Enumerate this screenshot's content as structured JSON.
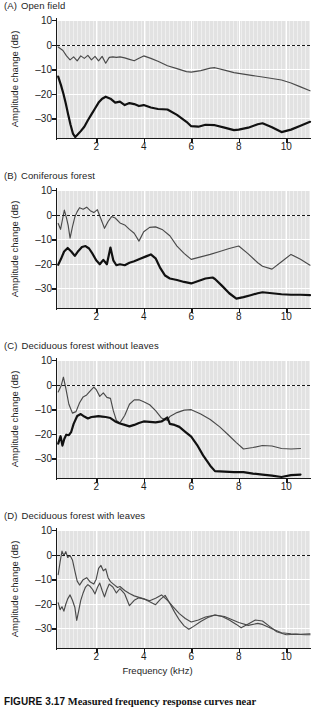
{
  "figure": {
    "caption_number": "FIGURE 3.17",
    "caption_text": "Measured frequency response curves near"
  },
  "axes": {
    "ylabel": "Amplitude change (dB)",
    "xlabel": "Frequency (kHz)",
    "yticks": [
      "10",
      "0",
      "–10",
      "–20",
      "–30"
    ],
    "xticks": [
      "2",
      "4",
      "6",
      "8",
      "10"
    ]
  },
  "panels": [
    {
      "tag": "(A)",
      "title": "Open field"
    },
    {
      "tag": "(B)",
      "title": "Coniferous forest"
    },
    {
      "tag": "(C)",
      "title": "Deciduous forest without leaves"
    },
    {
      "tag": "(D)",
      "title": "Deciduous forest with leaves"
    }
  ],
  "chart_data": {
    "type": "line",
    "title": "Measured frequency response curves near",
    "xlabel": "Frequency (kHz)",
    "ylabel": "Amplitude change (dB)",
    "xlim": [
      0.35,
      11.0
    ],
    "ylim": [
      -38,
      10
    ],
    "yticks": [
      10,
      0,
      -10,
      -20,
      -30
    ],
    "xticks": [
      2,
      4,
      6,
      8,
      10
    ],
    "grid": true,
    "legend": "none",
    "reference_line": {
      "y": 0,
      "style": "dashed"
    },
    "panels": [
      {
        "label": "(A)",
        "title": "Open field",
        "series": [
          {
            "name": "near-ground (thin)",
            "weight": "thin",
            "x": [
              0.4,
              0.6,
              0.75,
              0.9,
              1.05,
              1.2,
              1.35,
              1.5,
              1.65,
              1.8,
              1.95,
              2.1,
              2.25,
              2.4,
              2.55,
              2.7,
              2.85,
              3.0,
              3.2,
              3.4,
              3.6,
              3.8,
              4.0,
              4.3,
              4.6,
              5.0,
              5.4,
              5.8,
              6.0,
              6.4,
              6.8,
              7.0,
              7.4,
              7.8,
              8.2,
              8.6,
              9.0,
              9.4,
              9.8,
              10.2,
              10.6,
              11.0
            ],
            "y": [
              -1.0,
              -2.4,
              -4.6,
              -6.2,
              -5.0,
              -6.6,
              -4.6,
              -5.6,
              -4.4,
              -6.2,
              -4.8,
              -6.6,
              -4.8,
              -7.6,
              -5.2,
              -5.0,
              -5.2,
              -5.0,
              -5.4,
              -6.0,
              -6.6,
              -5.6,
              -4.6,
              -5.6,
              -6.8,
              -8.6,
              -9.8,
              -11.0,
              -11.2,
              -10.6,
              -9.6,
              -9.4,
              -10.4,
              -11.4,
              -12.0,
              -12.6,
              -13.2,
              -13.8,
              -14.4,
              -15.6,
              -17.2,
              -18.8
            ]
          },
          {
            "name": "far (thick)",
            "weight": "thick",
            "x": [
              0.4,
              0.52,
              0.62,
              0.72,
              0.82,
              0.92,
              1.02,
              1.12,
              1.22,
              1.35,
              1.5,
              1.65,
              1.8,
              1.95,
              2.1,
              2.25,
              2.4,
              2.6,
              2.8,
              3.0,
              3.2,
              3.4,
              3.6,
              3.8,
              4.0,
              4.3,
              4.6,
              5.0,
              5.4,
              5.8,
              6.0,
              6.3,
              6.6,
              7.0,
              7.4,
              7.8,
              8.0,
              8.4,
              8.8,
              9.0,
              9.4,
              9.8,
              10.2,
              10.6,
              11.0
            ],
            "y": [
              -13.0,
              -16.6,
              -20.0,
              -24.0,
              -28.4,
              -32.6,
              -36.2,
              -37.6,
              -36.6,
              -35.2,
              -33.4,
              -30.8,
              -28.4,
              -26.0,
              -23.6,
              -22.0,
              -21.2,
              -22.0,
              -23.6,
              -23.2,
              -24.6,
              -23.8,
              -24.2,
              -25.0,
              -24.6,
              -25.6,
              -26.2,
              -26.4,
              -28.6,
              -31.4,
              -33.2,
              -33.4,
              -32.6,
              -32.8,
              -33.8,
              -34.8,
              -34.6,
              -33.8,
              -32.4,
              -32.0,
              -33.6,
              -35.6,
              -34.6,
              -33.0,
              -31.4
            ]
          }
        ]
      },
      {
        "label": "(B)",
        "title": "Coniferous forest",
        "series": [
          {
            "name": "near-ground (thin)",
            "weight": "thin",
            "x": [
              0.4,
              0.5,
              0.58,
              0.66,
              0.74,
              0.82,
              0.9,
              1.0,
              1.1,
              1.2,
              1.3,
              1.45,
              1.6,
              1.75,
              1.9,
              2.05,
              2.2,
              2.35,
              2.5,
              2.65,
              2.8,
              3.0,
              3.2,
              3.4,
              3.6,
              3.8,
              4.0,
              4.25,
              4.5,
              4.8,
              5.1,
              5.4,
              5.7,
              6.0,
              6.4,
              6.8,
              7.2,
              7.6,
              8.0,
              8.4,
              8.8,
              9.0,
              9.4,
              9.8,
              10.2,
              10.6,
              11.0
            ],
            "y": [
              -3.6,
              -6.0,
              -2.0,
              1.8,
              -1.0,
              -4.4,
              -9.6,
              -5.0,
              -1.0,
              1.2,
              2.8,
              2.2,
              3.0,
              1.6,
              0.8,
              2.0,
              -1.8,
              -5.6,
              -2.8,
              -0.8,
              -1.4,
              -3.4,
              -4.2,
              -6.0,
              -7.6,
              -10.8,
              -7.0,
              -5.2,
              -5.0,
              -6.2,
              -8.6,
              -12.8,
              -15.8,
              -18.2,
              -17.2,
              -16.2,
              -15.0,
              -13.8,
              -12.8,
              -16.0,
              -19.6,
              -21.0,
              -22.2,
              -19.2,
              -16.2,
              -18.2,
              -20.6
            ]
          },
          {
            "name": "far (thick)",
            "weight": "thick",
            "x": [
              0.4,
              0.52,
              0.65,
              0.8,
              0.95,
              1.1,
              1.25,
              1.4,
              1.55,
              1.7,
              1.85,
              2.0,
              2.15,
              2.3,
              2.45,
              2.6,
              2.72,
              2.85,
              3.0,
              3.2,
              3.4,
              3.6,
              3.85,
              4.1,
              4.3,
              4.5,
              4.7,
              4.9,
              5.1,
              5.4,
              5.7,
              6.0,
              6.3,
              6.6,
              6.9,
              7.0,
              7.3,
              7.6,
              7.9,
              8.2,
              8.5,
              8.8,
              9.0,
              9.4,
              9.8,
              10.2,
              10.6,
              11.0
            ],
            "y": [
              -20.4,
              -18.0,
              -15.0,
              -13.6,
              -15.0,
              -16.8,
              -14.8,
              -13.2,
              -12.8,
              -13.8,
              -16.0,
              -18.6,
              -20.2,
              -18.4,
              -20.2,
              -13.4,
              -18.6,
              -20.6,
              -20.2,
              -20.6,
              -19.6,
              -19.0,
              -18.0,
              -17.0,
              -16.2,
              -17.8,
              -21.8,
              -24.8,
              -26.0,
              -26.6,
              -27.4,
              -28.0,
              -27.0,
              -26.0,
              -25.6,
              -26.2,
              -29.0,
              -32.0,
              -34.2,
              -33.6,
              -32.8,
              -32.0,
              -31.6,
              -32.0,
              -32.4,
              -32.6,
              -32.6,
              -32.8
            ]
          }
        ]
      },
      {
        "label": "(C)",
        "title": "Deciduous forest without leaves",
        "series": [
          {
            "name": "near-ground (thin)",
            "weight": "thin",
            "x": [
              0.4,
              0.52,
              0.62,
              0.72,
              0.85,
              1.0,
              1.15,
              1.3,
              1.45,
              1.6,
              1.75,
              1.9,
              2.0,
              2.15,
              2.3,
              2.45,
              2.6,
              2.72,
              2.85,
              3.0,
              3.2,
              3.4,
              3.6,
              3.8,
              4.0,
              4.25,
              4.5,
              4.75,
              5.0,
              5.1,
              5.4,
              5.7,
              6.0,
              6.4,
              6.8,
              7.2,
              7.6,
              7.9,
              8.2,
              8.6,
              9.0,
              9.4,
              9.8,
              10.2,
              10.6
            ],
            "y": [
              -3.0,
              -0.6,
              3.0,
              -1.4,
              -8.0,
              -11.6,
              -11.0,
              -7.4,
              -5.0,
              -4.2,
              -2.6,
              -1.0,
              -2.0,
              -4.8,
              -3.4,
              -5.2,
              -5.6,
              -10.6,
              -14.6,
              -15.6,
              -12.6,
              -8.0,
              -6.2,
              -6.2,
              -7.0,
              -8.2,
              -10.6,
              -13.6,
              -14.6,
              -13.0,
              -11.4,
              -10.4,
              -10.2,
              -12.0,
              -14.2,
              -17.2,
              -20.8,
              -23.6,
              -26.2,
              -25.6,
              -24.8,
              -25.0,
              -26.0,
              -26.2,
              -26.0
            ]
          },
          {
            "name": "far (thick)",
            "weight": "thick",
            "x": [
              0.4,
              0.5,
              0.58,
              0.66,
              0.74,
              0.85,
              0.95,
              1.05,
              1.2,
              1.35,
              1.5,
              1.65,
              1.8,
              1.95,
              2.1,
              2.25,
              2.4,
              2.6,
              2.8,
              3.0,
              3.2,
              3.4,
              3.6,
              3.8,
              4.0,
              4.25,
              4.5,
              4.75,
              5.0,
              5.1,
              5.3,
              5.5,
              5.75,
              6.0,
              6.25,
              6.5,
              6.8,
              7.0,
              7.4,
              7.8,
              8.2,
              8.6,
              9.0,
              9.4,
              9.8,
              10.2,
              10.6
            ],
            "y": [
              -24.0,
              -21.0,
              -24.8,
              -22.0,
              -20.4,
              -20.6,
              -19.2,
              -16.0,
              -12.8,
              -12.0,
              -13.0,
              -13.8,
              -13.2,
              -13.0,
              -12.8,
              -13.0,
              -13.2,
              -13.6,
              -15.0,
              -15.8,
              -16.4,
              -17.0,
              -16.4,
              -15.6,
              -15.0,
              -15.2,
              -15.4,
              -15.0,
              -13.4,
              -16.0,
              -16.4,
              -17.2,
              -19.2,
              -21.2,
              -24.6,
              -28.8,
              -33.0,
              -35.2,
              -35.4,
              -35.6,
              -35.6,
              -36.2,
              -36.6,
              -37.0,
              -37.6,
              -36.8,
              -36.6
            ]
          }
        ]
      },
      {
        "label": "(D)",
        "title": "Deciduous forest with leaves",
        "series": [
          {
            "name": "near-ground (thin)",
            "weight": "thin",
            "x": [
              0.4,
              0.48,
              0.56,
              0.64,
              0.72,
              0.8,
              0.9,
              1.0,
              1.1,
              1.2,
              1.3,
              1.45,
              1.6,
              1.75,
              1.9,
              2.0,
              2.1,
              2.2,
              2.3,
              2.4,
              2.5,
              2.6,
              2.75,
              2.9,
              3.0,
              3.2,
              3.4,
              3.6,
              3.8,
              4.0,
              4.25,
              4.5,
              4.75,
              5.0,
              5.25,
              5.5,
              5.75,
              6.0,
              6.3,
              6.6,
              7.0,
              7.4,
              7.8,
              8.0,
              8.4,
              8.8,
              9.0,
              9.4,
              9.8,
              10.2,
              10.6,
              11.0
            ],
            "y": [
              -8.2,
              -3.0,
              1.4,
              -0.4,
              1.2,
              -1.2,
              -0.4,
              -2.2,
              -6.6,
              -10.8,
              -12.4,
              -10.2,
              -9.4,
              -11.2,
              -12.0,
              -10.0,
              -5.6,
              -4.4,
              -6.6,
              -5.8,
              -9.4,
              -11.0,
              -12.2,
              -13.4,
              -13.0,
              -14.6,
              -15.8,
              -16.8,
              -17.4,
              -18.0,
              -18.8,
              -17.8,
              -16.4,
              -18.6,
              -21.4,
              -24.0,
              -26.0,
              -27.4,
              -26.6,
              -25.4,
              -24.6,
              -25.2,
              -26.8,
              -27.6,
              -28.8,
              -28.0,
              -28.4,
              -30.2,
              -31.8,
              -32.2,
              -32.4,
              -32.2
            ]
          },
          {
            "name": "far (thick)",
            "weight": "thin",
            "x": [
              0.4,
              0.48,
              0.56,
              0.64,
              0.72,
              0.8,
              0.9,
              1.0,
              1.1,
              1.18,
              1.26,
              1.35,
              1.45,
              1.55,
              1.65,
              1.75,
              1.85,
              1.95,
              2.05,
              2.15,
              2.25,
              2.35,
              2.45,
              2.55,
              2.7,
              2.85,
              3.0,
              3.2,
              3.4,
              3.6,
              3.8,
              4.0,
              4.25,
              4.5,
              4.7,
              4.9,
              5.1,
              5.3,
              5.5,
              5.7,
              5.9,
              6.1,
              6.4,
              6.7,
              7.0,
              7.3,
              7.6,
              7.9,
              8.1,
              8.4,
              8.7,
              9.0,
              9.3,
              9.6,
              10.0,
              10.4,
              10.8,
              11.0
            ],
            "y": [
              -19.6,
              -22.4,
              -21.2,
              -23.0,
              -20.2,
              -18.0,
              -16.4,
              -18.6,
              -21.4,
              -26.8,
              -23.0,
              -18.6,
              -15.6,
              -13.2,
              -12.2,
              -13.0,
              -14.2,
              -16.0,
              -13.4,
              -11.6,
              -14.6,
              -17.2,
              -14.2,
              -12.0,
              -13.2,
              -15.6,
              -13.8,
              -16.0,
              -20.8,
              -18.6,
              -17.6,
              -18.0,
              -19.2,
              -20.4,
              -18.2,
              -16.6,
              -19.8,
              -23.4,
              -26.6,
              -29.0,
              -30.4,
              -29.2,
              -27.2,
              -25.6,
              -24.6,
              -25.2,
              -26.6,
              -28.4,
              -29.8,
              -28.2,
              -26.6,
              -27.0,
              -29.2,
              -31.4,
              -32.6,
              -32.4,
              -32.6,
              -32.6
            ]
          }
        ]
      }
    ]
  }
}
